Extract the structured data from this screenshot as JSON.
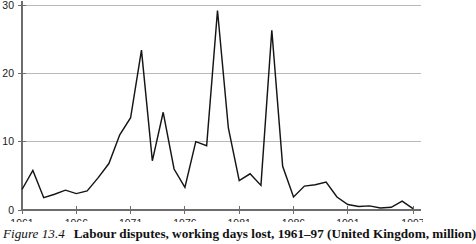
{
  "caption": {
    "figure_number": "Figure 13.4",
    "text": "Labour disputes, working days lost, 1961–97 (United Kingdom, million)"
  },
  "chart_data": {
    "type": "line",
    "title": "",
    "subtitle": "",
    "xlabel": "",
    "ylabel": "",
    "units": "million working days lost",
    "grid": true,
    "grid_axis": "y",
    "legend": false,
    "legend_position": "none",
    "xlim": [
      1961,
      1997
    ],
    "ylim": [
      0,
      30
    ],
    "yticks": [
      0,
      10,
      20,
      30
    ],
    "ytick_labels": [
      "0",
      "10",
      "20",
      "30"
    ],
    "xticks": [
      1961,
      1966,
      1971,
      1976,
      1981,
      1986,
      1991,
      1997
    ],
    "xtick_labels": [
      "1961",
      "1966",
      "1971",
      "1976",
      "1981",
      "1986",
      "1991",
      "1997"
    ],
    "x": [
      1961,
      1962,
      1963,
      1964,
      1965,
      1966,
      1967,
      1968,
      1969,
      1970,
      1971,
      1972,
      1973,
      1974,
      1975,
      1976,
      1977,
      1978,
      1979,
      1980,
      1981,
      1982,
      1983,
      1984,
      1985,
      1986,
      1987,
      1988,
      1989,
      1990,
      1991,
      1992,
      1993,
      1994,
      1995,
      1996,
      1997
    ],
    "series": [
      {
        "name": "Working days lost",
        "color": "#151515",
        "values": [
          3.0,
          5.8,
          1.8,
          2.3,
          2.9,
          2.4,
          2.8,
          4.7,
          6.8,
          11.0,
          13.5,
          23.4,
          7.2,
          14.3,
          6.0,
          3.3,
          10.0,
          9.4,
          29.2,
          12.0,
          4.3,
          5.3,
          3.6,
          26.3,
          6.4,
          1.9,
          3.5,
          3.7,
          4.1,
          1.9,
          0.8,
          0.5,
          0.6,
          0.3,
          0.4,
          1.3,
          0.2
        ]
      }
    ]
  },
  "axes": {
    "y_axis_name": "days-lost-millions",
    "x_axis_name": "year"
  }
}
